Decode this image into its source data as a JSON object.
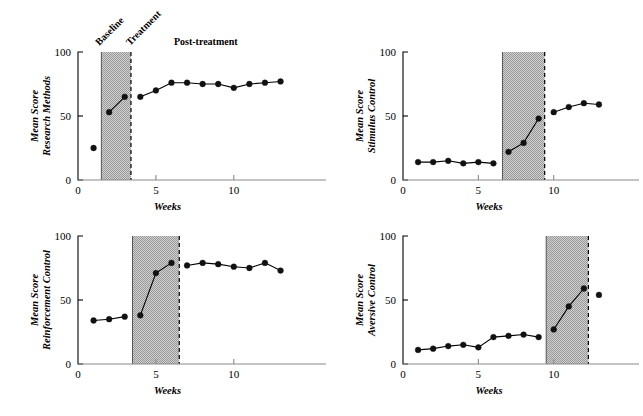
{
  "figure": {
    "background": "#ffffff",
    "ink": "#000000",
    "band_fill": "#b9b9b9",
    "axis_gray": "#8a8a8a"
  },
  "common": {
    "xlabel": "Weeks",
    "ylabel_top": "Mean Score",
    "y_ticks": [
      "0",
      "50",
      "100"
    ],
    "x_ticks": [
      "0",
      "5",
      "10"
    ]
  },
  "panels": [
    {
      "id": "research-methods",
      "ylabel_bottom": "Research Methods",
      "phase_labels": {
        "baseline": "Baseline",
        "treatment": "Treatment",
        "post": "Post-treatment"
      }
    },
    {
      "id": "stimulus-control",
      "ylabel_bottom": "Stimulus Control"
    },
    {
      "id": "reinforcement-control",
      "ylabel_bottom": "Reinforcement Control"
    },
    {
      "id": "aversive-control",
      "ylabel_bottom": "Aversive Control"
    }
  ],
  "chart_data": [
    {
      "type": "line",
      "title": "Research Methods",
      "xlabel": "Weeks",
      "ylabel": "Mean Score Research Methods",
      "xlim": [
        0,
        13.8
      ],
      "ylim": [
        0,
        100
      ],
      "xticks": [
        0,
        5,
        10
      ],
      "yticks": [
        0,
        50,
        100
      ],
      "grid": false,
      "legend": "none",
      "annotations": [
        "Baseline",
        "Treatment",
        "Post-treatment"
      ],
      "treatment_band": {
        "x_start": 1.5,
        "x_end": 3.4,
        "label": "Treatment"
      },
      "segments": [
        {
          "phase": "baseline",
          "x": [
            1
          ],
          "y": [
            25
          ]
        },
        {
          "phase": "treatment",
          "x": [
            2,
            3
          ],
          "y": [
            53,
            65
          ]
        },
        {
          "phase": "post-treatment",
          "x": [
            4,
            5,
            6,
            7,
            8,
            9,
            10,
            11,
            12,
            13
          ],
          "y": [
            65,
            70,
            76,
            76,
            75,
            75,
            72,
            75,
            76,
            77
          ]
        }
      ]
    },
    {
      "type": "line",
      "title": "Stimulus Control",
      "xlabel": "Weeks",
      "ylabel": "Mean Score Stimulus Control",
      "xlim": [
        0,
        13.8
      ],
      "ylim": [
        0,
        100
      ],
      "xticks": [
        0,
        5,
        10
      ],
      "yticks": [
        0,
        50,
        100
      ],
      "grid": false,
      "legend": "none",
      "treatment_band": {
        "x_start": 6.6,
        "x_end": 9.4,
        "label": "Treatment"
      },
      "segments": [
        {
          "phase": "baseline",
          "x": [
            1,
            2,
            3,
            4,
            5,
            6
          ],
          "y": [
            14,
            14,
            15,
            13,
            14,
            13
          ]
        },
        {
          "phase": "treatment",
          "x": [
            7,
            8,
            9
          ],
          "y": [
            22,
            29,
            48
          ]
        },
        {
          "phase": "post-treatment",
          "x": [
            10,
            11,
            12,
            13
          ],
          "y": [
            53,
            57,
            60,
            59
          ]
        }
      ]
    },
    {
      "type": "line",
      "title": "Reinforcement Control",
      "xlabel": "Weeks",
      "ylabel": "Mean Score Reinforcement Control",
      "xlim": [
        0,
        13.8
      ],
      "ylim": [
        0,
        100
      ],
      "xticks": [
        0,
        5,
        10
      ],
      "yticks": [
        0,
        50,
        100
      ],
      "grid": false,
      "legend": "none",
      "treatment_band": {
        "x_start": 3.5,
        "x_end": 6.5,
        "label": "Treatment"
      },
      "segments": [
        {
          "phase": "baseline",
          "x": [
            1,
            2,
            3
          ],
          "y": [
            34,
            35,
            37
          ]
        },
        {
          "phase": "treatment",
          "x": [
            4,
            5,
            6
          ],
          "y": [
            38,
            71,
            79
          ]
        },
        {
          "phase": "post-treatment",
          "x": [
            7,
            8,
            9,
            10,
            11,
            12,
            13
          ],
          "y": [
            77,
            79,
            78,
            76,
            75,
            79,
            73
          ]
        }
      ]
    },
    {
      "type": "line",
      "title": "Aversive Control",
      "xlabel": "Weeks",
      "ylabel": "Mean Score Aversive Control",
      "xlim": [
        0,
        13.8
      ],
      "ylim": [
        0,
        100
      ],
      "xticks": [
        0,
        5,
        10
      ],
      "yticks": [
        0,
        50,
        100
      ],
      "grid": false,
      "legend": "none",
      "treatment_band": {
        "x_start": 9.5,
        "x_end": 12.3,
        "label": "Treatment"
      },
      "segments": [
        {
          "phase": "baseline",
          "x": [
            1,
            2,
            3,
            4,
            5,
            6,
            7,
            8,
            9
          ],
          "y": [
            11,
            12,
            14,
            15,
            13,
            21,
            22,
            23,
            21
          ]
        },
        {
          "phase": "treatment",
          "x": [
            10,
            11,
            12
          ],
          "y": [
            27,
            45,
            59
          ]
        },
        {
          "phase": "post-treatment",
          "x": [
            13
          ],
          "y": [
            54
          ]
        }
      ]
    }
  ]
}
